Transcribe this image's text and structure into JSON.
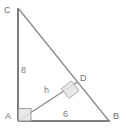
{
  "figure": {
    "kind": "geometry-diagram",
    "canvas": {
      "width": 126,
      "height": 129,
      "background": "#ffffff"
    },
    "colors": {
      "stroke": "#7d7d7d",
      "label": "#6d6d6d",
      "right_angle_fill": "#e3e3e3",
      "right_angle_stroke": "#9a9a9a"
    },
    "points": {
      "A": {
        "label": "A",
        "x": 18,
        "y": 121
      },
      "B": {
        "label": "B",
        "x": 109,
        "y": 121
      },
      "C": {
        "label": "C",
        "x": 18,
        "y": 8
      },
      "D": {
        "label": "D",
        "x": 77,
        "y": 82
      }
    },
    "segments": [
      {
        "name": "leg-AC",
        "from": "A",
        "to": "C",
        "label": "8"
      },
      {
        "name": "leg-AB",
        "from": "A",
        "to": "B",
        "label": "6"
      },
      {
        "name": "hypotenuse-CB",
        "from": "C",
        "to": "B",
        "label": ""
      },
      {
        "name": "altitude-AD",
        "from": "A",
        "to": "D",
        "label": "h"
      }
    ],
    "measures": {
      "vertical_leg": "8",
      "horizontal_leg": "6",
      "altitude": "h"
    },
    "right_angles": [
      {
        "at": "A",
        "style": "axis-aligned-square"
      },
      {
        "at": "D",
        "style": "rotated-square"
      }
    ]
  }
}
